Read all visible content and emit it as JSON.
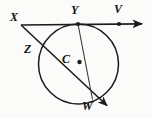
{
  "figure": {
    "name": "circle-tangent-secant-diagram",
    "type": "geometry-diagram",
    "width": 152,
    "height": 118,
    "background_color": "#fbfbf9",
    "stroke_color": "#1c1c1c",
    "label_color": "#121212"
  },
  "labels": {
    "X": "X",
    "Y": "Y",
    "V": "V",
    "Z": "Z",
    "C": "C",
    "W": "W"
  },
  "label_positions": {
    "X": {
      "x": 10,
      "y": 12
    },
    "Y": {
      "x": 70,
      "y": 5
    },
    "V": {
      "x": 113,
      "y": 4
    },
    "Z": {
      "x": 24,
      "y": 43
    },
    "C": {
      "x": 62,
      "y": 52
    },
    "W": {
      "x": 82,
      "y": 99
    }
  },
  "points": {
    "X": {
      "x": 21,
      "y": 25
    },
    "Y": {
      "x": 78,
      "y": 24
    },
    "V": {
      "x": 119,
      "y": 24
    },
    "Z": {
      "x": 43,
      "y": 53
    },
    "C": {
      "x": 79,
      "y": 62
    },
    "W": {
      "x": 92,
      "y": 99
    }
  },
  "circle": {
    "center_x": 78.5,
    "center_y": 64,
    "radius": 40
  },
  "segments": [
    {
      "name": "tangent-ray-XV",
      "from": "X",
      "to": "arrow-right",
      "x1": 21,
      "y1": 25,
      "x2": 147,
      "y2": 24,
      "arrow": true
    },
    {
      "name": "secant-ray-XZW",
      "from": "X",
      "to": "arrow-lower-right",
      "x1": 21,
      "y1": 25,
      "x2": 113,
      "y2": 111,
      "arrow": true
    },
    {
      "name": "chord-YW",
      "from": "Y",
      "to": "W",
      "x1": 78,
      "y1": 24,
      "x2": 92,
      "y2": 99,
      "arrow": false
    }
  ],
  "dots": [
    {
      "name": "point-dot-Y",
      "x": 78,
      "y": 24
    },
    {
      "name": "point-dot-V",
      "x": 119,
      "y": 24
    },
    {
      "name": "point-dot-C",
      "x": 79.5,
      "y": 62
    }
  ]
}
